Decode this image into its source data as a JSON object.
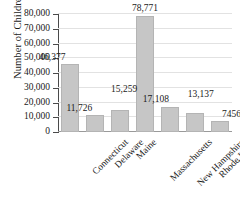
{
  "chart_data": {
    "type": "bar",
    "title": "",
    "subtitle": "",
    "xlabel": "",
    "ylabel": "Number of Children",
    "categories": [
      "Connecticut",
      "Delaware",
      "Maine",
      "Massachusetts",
      "New Hampshire",
      "Rhode Island",
      "Vermont"
    ],
    "values": [
      46377,
      11726,
      15259,
      78771,
      17108,
      13137,
      7456
    ],
    "value_labels": [
      "46,377",
      "11,726",
      "15,259",
      "78,771",
      "17,108",
      "13,137",
      "7456"
    ],
    "ylim": [
      0,
      80000
    ],
    "ytick_labels": [
      "0",
      "10,000",
      "20,000",
      "30,000",
      "40,000",
      "50,000",
      "60,000",
      "70,000",
      "80,000"
    ],
    "ytick_values": [
      0,
      10000,
      20000,
      30000,
      40000,
      50000,
      60000,
      70000,
      80000
    ],
    "grid": true,
    "legend": false,
    "legend_position": "none",
    "bar_color": "#c6c6c6",
    "bar_edge_color": "#b4b4b4",
    "gridline_color": "#e2e2e2",
    "axis_color": "#4a4a4a",
    "text_color": "#1a1a1a",
    "xlabel_rotation": -45
  }
}
